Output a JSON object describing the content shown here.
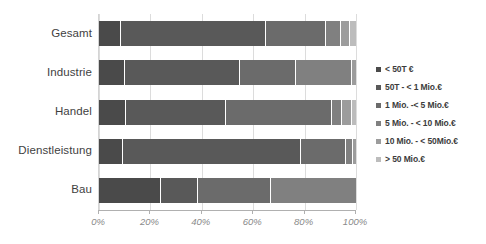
{
  "chart_data": {
    "type": "bar",
    "orientation": "horizontal",
    "stacked": true,
    "normalized": true,
    "title": "",
    "xlabel": "",
    "ylabel": "",
    "xlim": [
      0,
      100
    ],
    "grid": true,
    "legend_position": "right",
    "categories": [
      "Gesamt",
      "Industrie",
      "Handel",
      "Dienstleistung",
      "Bau"
    ],
    "xticks": [
      "0%",
      "20%",
      "40%",
      "60%",
      "80%",
      "100%"
    ],
    "xtick_values": [
      0,
      20,
      40,
      60,
      80,
      100
    ],
    "series": [
      {
        "name": "< 50T €",
        "color": "#4a4a4a",
        "values": [
          8.5,
          10.0,
          10.5,
          9.5,
          24.0
        ]
      },
      {
        "name": "50T - < 1 Mio.€",
        "color": "#595959",
        "values": [
          56.5,
          45.0,
          39.0,
          69.0,
          14.5
        ]
      },
      {
        "name": "1 Mio. -< 5 Mio.€",
        "color": "#6b6b6b",
        "values": [
          23.5,
          21.5,
          41.0,
          17.5,
          28.5
        ]
      },
      {
        "name": "5 Mio. - < 10 Mio.€",
        "color": "#808080",
        "values": [
          5.5,
          22.0,
          4.0,
          3.0,
          33.0
        ]
      },
      {
        "name": "10 Mio. - < 50Mio.€",
        "color": "#9c9c9c",
        "values": [
          3.5,
          1.5,
          4.0,
          1.0,
          0.0
        ]
      },
      {
        "name": "> 50 Mio.€",
        "color": "#bcbcbc",
        "values": [
          2.5,
          0.0,
          1.5,
          0.0,
          0.0
        ]
      }
    ]
  }
}
